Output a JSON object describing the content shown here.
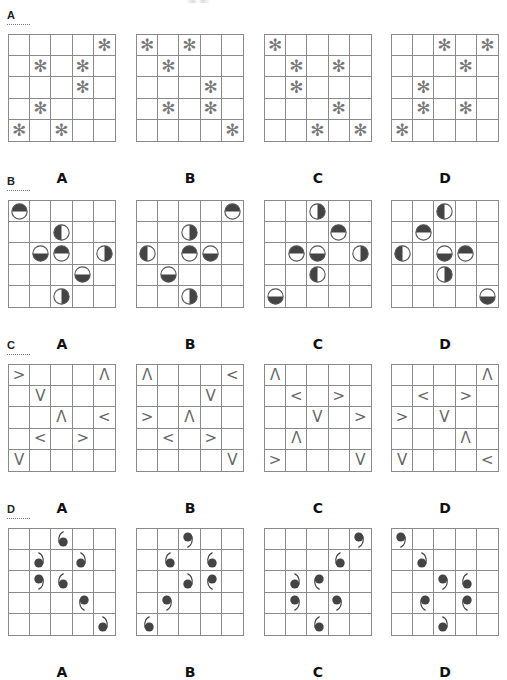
{
  "colors": {
    "grid_line": "#8a8a8a",
    "symbol_gray": "#777777",
    "fill_dark": "#444444"
  },
  "sections": [
    {
      "id": "A",
      "header": "A",
      "symbol_type": "asterisk",
      "symbol_glyph": "✻",
      "options": [
        {
          "label": "A",
          "cells": [
            [
              0,
              4
            ],
            [
              1,
              1
            ],
            [
              1,
              3
            ],
            [
              2,
              3
            ],
            [
              3,
              1
            ],
            [
              4,
              0
            ],
            [
              4,
              2
            ]
          ]
        },
        {
          "label": "B",
          "cells": [
            [
              0,
              0
            ],
            [
              0,
              2
            ],
            [
              1,
              1
            ],
            [
              2,
              3
            ],
            [
              3,
              1
            ],
            [
              3,
              3
            ],
            [
              4,
              4
            ]
          ]
        },
        {
          "label": "C",
          "cells": [
            [
              0,
              0
            ],
            [
              1,
              1
            ],
            [
              1,
              3
            ],
            [
              2,
              1
            ],
            [
              3,
              3
            ],
            [
              4,
              2
            ],
            [
              4,
              4
            ]
          ]
        },
        {
          "label": "D",
          "cells": [
            [
              0,
              2
            ],
            [
              0,
              4
            ],
            [
              1,
              3
            ],
            [
              2,
              1
            ],
            [
              3,
              1
            ],
            [
              3,
              3
            ],
            [
              4,
              0
            ]
          ]
        }
      ]
    },
    {
      "id": "B",
      "header": "B",
      "symbol_type": "half-filled-circle",
      "options": [
        {
          "label": "A",
          "cells": [
            [
              0,
              0,
              "top"
            ],
            [
              1,
              2,
              "left"
            ],
            [
              2,
              1,
              "bottom"
            ],
            [
              2,
              2,
              "top"
            ],
            [
              2,
              4,
              "right"
            ],
            [
              3,
              3,
              "bottom"
            ],
            [
              4,
              2,
              "right"
            ]
          ]
        },
        {
          "label": "B",
          "cells": [
            [
              0,
              4,
              "top"
            ],
            [
              1,
              2,
              "right"
            ],
            [
              2,
              0,
              "left"
            ],
            [
              2,
              2,
              "top"
            ],
            [
              2,
              3,
              "bottom"
            ],
            [
              3,
              1,
              "bottom"
            ],
            [
              4,
              2,
              "right"
            ]
          ]
        },
        {
          "label": "C",
          "cells": [
            [
              0,
              2,
              "right"
            ],
            [
              1,
              3,
              "top"
            ],
            [
              2,
              1,
              "top"
            ],
            [
              2,
              2,
              "bottom"
            ],
            [
              2,
              4,
              "right"
            ],
            [
              3,
              2,
              "left"
            ],
            [
              4,
              0,
              "bottom"
            ]
          ]
        },
        {
          "label": "D",
          "cells": [
            [
              0,
              2,
              "left"
            ],
            [
              1,
              1,
              "top"
            ],
            [
              2,
              0,
              "left"
            ],
            [
              2,
              2,
              "bottom"
            ],
            [
              2,
              3,
              "top"
            ],
            [
              3,
              2,
              "right"
            ],
            [
              4,
              4,
              "bottom"
            ]
          ]
        }
      ]
    },
    {
      "id": "C",
      "header": "C",
      "symbol_type": "chevron",
      "glyphs": {
        "right": ">",
        "left": "<",
        "up": "Λ",
        "down": "V"
      },
      "options": [
        {
          "label": "A",
          "cells": [
            [
              0,
              0,
              "right"
            ],
            [
              0,
              4,
              "up"
            ],
            [
              1,
              1,
              "down"
            ],
            [
              2,
              2,
              "up"
            ],
            [
              2,
              4,
              "left"
            ],
            [
              3,
              1,
              "left"
            ],
            [
              3,
              3,
              "right"
            ],
            [
              4,
              0,
              "down"
            ]
          ]
        },
        {
          "label": "B",
          "cells": [
            [
              0,
              0,
              "up"
            ],
            [
              0,
              4,
              "left"
            ],
            [
              1,
              3,
              "down"
            ],
            [
              2,
              0,
              "right"
            ],
            [
              2,
              2,
              "up"
            ],
            [
              3,
              1,
              "left"
            ],
            [
              3,
              3,
              "right"
            ],
            [
              4,
              4,
              "down"
            ]
          ]
        },
        {
          "label": "C",
          "cells": [
            [
              0,
              0,
              "up"
            ],
            [
              1,
              1,
              "left"
            ],
            [
              1,
              3,
              "right"
            ],
            [
              2,
              2,
              "down"
            ],
            [
              2,
              4,
              "right"
            ],
            [
              3,
              1,
              "up"
            ],
            [
              4,
              0,
              "right"
            ],
            [
              4,
              4,
              "down"
            ]
          ]
        },
        {
          "label": "D",
          "cells": [
            [
              0,
              4,
              "up"
            ],
            [
              1,
              1,
              "left"
            ],
            [
              1,
              3,
              "right"
            ],
            [
              2,
              0,
              "right"
            ],
            [
              2,
              2,
              "down"
            ],
            [
              3,
              3,
              "up"
            ],
            [
              4,
              0,
              "down"
            ],
            [
              4,
              4,
              "left"
            ]
          ]
        }
      ]
    },
    {
      "id": "D",
      "header": "D",
      "symbol_type": "dot-with-tail",
      "options": [
        {
          "label": "A",
          "cells": [
            [
              0,
              2,
              "tl"
            ],
            [
              1,
              1,
              "tr"
            ],
            [
              1,
              3,
              "tr"
            ],
            [
              2,
              1,
              "br"
            ],
            [
              2,
              2,
              "tl"
            ],
            [
              3,
              3,
              "bl"
            ],
            [
              4,
              4,
              "tr"
            ]
          ]
        },
        {
          "label": "B",
          "cells": [
            [
              0,
              2,
              "br"
            ],
            [
              1,
              1,
              "tl"
            ],
            [
              1,
              3,
              "tl"
            ],
            [
              2,
              2,
              "tr"
            ],
            [
              2,
              3,
              "bl"
            ],
            [
              3,
              1,
              "br"
            ],
            [
              4,
              0,
              "tl"
            ]
          ]
        },
        {
          "label": "C",
          "cells": [
            [
              0,
              4,
              "br"
            ],
            [
              1,
              3,
              "tl"
            ],
            [
              2,
              1,
              "tr"
            ],
            [
              2,
              2,
              "bl"
            ],
            [
              3,
              1,
              "br"
            ],
            [
              3,
              3,
              "br"
            ],
            [
              4,
              2,
              "tl"
            ]
          ]
        },
        {
          "label": "D",
          "cells": [
            [
              0,
              0,
              "br"
            ],
            [
              1,
              1,
              "tr"
            ],
            [
              2,
              2,
              "br"
            ],
            [
              2,
              3,
              "tl"
            ],
            [
              3,
              1,
              "bl"
            ],
            [
              3,
              3,
              "bl"
            ],
            [
              4,
              2,
              "tr"
            ]
          ]
        }
      ]
    }
  ]
}
